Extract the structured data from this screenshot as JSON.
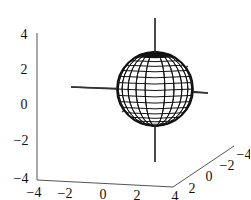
{
  "chart_data": {
    "type": "3d-surface",
    "title": "",
    "surface": {
      "shape": "sphere",
      "center": [
        0,
        0,
        0
      ],
      "radius": 2,
      "mesh": "latitude-longitude wireframe",
      "color": "#000000"
    },
    "axis_lines": [
      {
        "name": "x-axis-line",
        "from": [
          -4,
          0,
          0
        ],
        "to": [
          4,
          0,
          0
        ]
      },
      {
        "name": "y-axis-line",
        "from": [
          0,
          -4,
          0
        ],
        "to": [
          0,
          4,
          0
        ]
      },
      {
        "name": "z-axis-line",
        "from": [
          0,
          0,
          -4
        ],
        "to": [
          0,
          0,
          4
        ]
      }
    ],
    "axes": {
      "x": {
        "label": "",
        "range": [
          -4,
          4
        ],
        "ticks": [
          "-4",
          "-2",
          "0",
          "2",
          "4"
        ]
      },
      "y": {
        "label": "",
        "range": [
          -4,
          4
        ],
        "ticks": [
          "2",
          "0",
          "-2",
          "-4"
        ]
      },
      "z": {
        "label": "",
        "range": [
          -4,
          4
        ],
        "ticks": [
          "4",
          "2",
          "0",
          "-2",
          "-4"
        ]
      }
    },
    "grid": false,
    "legend": null
  },
  "labels": {
    "z_ticks": [
      "4",
      "2",
      "0",
      "−2",
      "−4"
    ],
    "x_ticks": [
      "−4",
      "−2",
      "0",
      "2",
      "4"
    ],
    "y_ticks": [
      "2",
      "0",
      "−2",
      "−4"
    ]
  }
}
